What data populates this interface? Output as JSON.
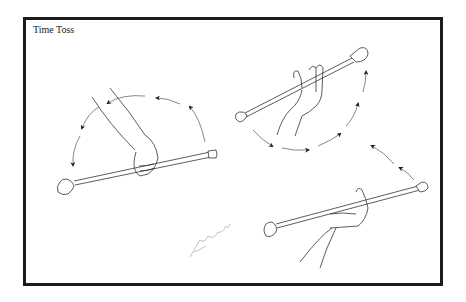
{
  "figure": {
    "title": "Time Toss",
    "border_color": "#1c1c1c",
    "line_color": "#333333",
    "panels": [
      {
        "id": "panel-1",
        "description": "hand gripping baton, arrows arc overhead from right to left"
      },
      {
        "id": "panel-2",
        "description": "open hand tossing baton upward, arrows curve right and up"
      },
      {
        "id": "panel-3",
        "description": "hand catching baton from below, arrows curve up-left"
      }
    ],
    "signature_icon": "artist-signature"
  }
}
